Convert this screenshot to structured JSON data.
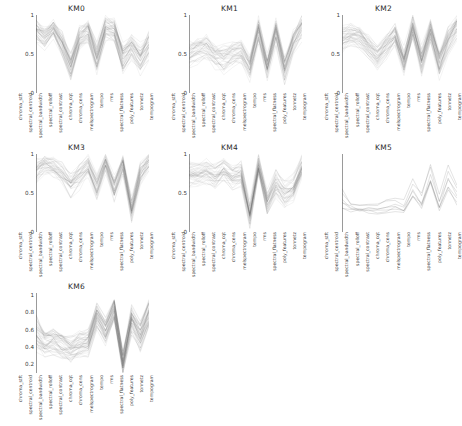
{
  "figure": {
    "type": "parallel-coordinates-grid",
    "background": "#ffffff",
    "line_color": "#555555",
    "grid_rows": 3,
    "grid_cols": 3,
    "panel_count": 7
  },
  "features": [
    "chroma_stft",
    "spectral_centroid",
    "spectral_bandwidth",
    "spectral_rolloff",
    "spectral_contrast",
    "chroma_cqt",
    "chroma_cens",
    "melspectrogram",
    "tempo",
    "rms",
    "spectral_flatness",
    "poly_features",
    "tonnetz",
    "tempogram"
  ],
  "panels": [
    {
      "id": "KM0",
      "title": "KM0",
      "row": 0,
      "col": 0,
      "yticks": [
        "0",
        "0.5",
        "1"
      ],
      "ytick_values": [
        0,
        0.5,
        1
      ],
      "ylim": [
        0,
        1
      ],
      "n_lines": 46,
      "density": "dense"
    },
    {
      "id": "KM1",
      "title": "KM1",
      "row": 0,
      "col": 1,
      "yticks": [
        "0",
        "0.5",
        "1"
      ],
      "ytick_values": [
        0,
        0.5,
        1
      ],
      "ylim": [
        0,
        1
      ],
      "n_lines": 40,
      "density": "dense"
    },
    {
      "id": "KM2",
      "title": "KM2",
      "row": 0,
      "col": 2,
      "yticks": [
        "0",
        "0.5",
        "1"
      ],
      "ytick_values": [
        0,
        0.5,
        1
      ],
      "ylim": [
        0,
        1
      ],
      "n_lines": 44,
      "density": "dense"
    },
    {
      "id": "KM3",
      "title": "KM3",
      "row": 1,
      "col": 0,
      "yticks": [
        "0",
        "0.5",
        "1"
      ],
      "ytick_values": [
        0,
        0.5,
        1
      ],
      "ylim": [
        0,
        1
      ],
      "n_lines": 38,
      "density": "dense"
    },
    {
      "id": "KM4",
      "title": "KM4",
      "row": 1,
      "col": 1,
      "yticks": [
        "0",
        "0.5",
        "1"
      ],
      "ytick_values": [
        0,
        0.5,
        1
      ],
      "ylim": [
        0,
        1
      ],
      "n_lines": 42,
      "density": "dense"
    },
    {
      "id": "KM5",
      "title": "KM5",
      "row": 1,
      "col": 2,
      "yticks": [],
      "ytick_values": [],
      "ylim": [
        0,
        1
      ],
      "n_lines": 7,
      "density": "sparse"
    },
    {
      "id": "KM6",
      "title": "KM6",
      "row": 2,
      "col": 0,
      "yticks": [
        "0.2",
        "0.4",
        "0.6",
        "0.8",
        "1"
      ],
      "ytick_values": [
        0.2,
        0.4,
        0.6,
        0.8,
        1
      ],
      "ylim": [
        0.1,
        1.02
      ],
      "n_lines": 48,
      "density": "dense"
    }
  ],
  "chart_data": {
    "type": "line",
    "title": "",
    "xlabel": "",
    "ylabel": "",
    "grid": false,
    "legend": "none",
    "categories": [
      "chroma_stft",
      "spectral_centroid",
      "spectral_bandwidth",
      "spectral_rolloff",
      "spectral_contrast",
      "chroma_cqt",
      "chroma_cens",
      "melspectrogram",
      "tempo",
      "rms",
      "spectral_flatness",
      "poly_features",
      "tonnetz",
      "tempogram"
    ],
    "panels": [
      {
        "name": "KM0",
        "ylim": [
          0,
          1
        ],
        "mean_profile": [
          0.79,
          0.7,
          0.82,
          0.62,
          0.33,
          0.7,
          0.79,
          0.44,
          0.82,
          0.8,
          0.45,
          0.58,
          0.43,
          0.62
        ],
        "band_low": [
          0.66,
          0.58,
          0.71,
          0.49,
          0.18,
          0.57,
          0.66,
          0.27,
          0.68,
          0.66,
          0.3,
          0.44,
          0.27,
          0.46
        ],
        "band_high": [
          0.9,
          0.82,
          0.93,
          0.76,
          0.5,
          0.84,
          0.92,
          0.62,
          0.95,
          0.92,
          0.62,
          0.73,
          0.6,
          0.79
        ]
      },
      {
        "name": "KM1",
        "ylim": [
          0,
          1
        ],
        "mean_profile": [
          0.5,
          0.55,
          0.58,
          0.48,
          0.44,
          0.5,
          0.52,
          0.32,
          0.8,
          0.33,
          0.78,
          0.3,
          0.66,
          0.85
        ],
        "band_low": [
          0.36,
          0.41,
          0.45,
          0.34,
          0.29,
          0.36,
          0.38,
          0.18,
          0.64,
          0.19,
          0.63,
          0.16,
          0.5,
          0.68
        ],
        "band_high": [
          0.64,
          0.7,
          0.72,
          0.63,
          0.6,
          0.65,
          0.67,
          0.48,
          0.93,
          0.49,
          0.92,
          0.46,
          0.82,
          0.97
        ]
      },
      {
        "name": "KM2",
        "ylim": [
          0,
          1
        ],
        "mean_profile": [
          0.7,
          0.75,
          0.72,
          0.6,
          0.46,
          0.62,
          0.74,
          0.4,
          0.84,
          0.42,
          0.8,
          0.38,
          0.68,
          0.86
        ],
        "band_low": [
          0.56,
          0.62,
          0.59,
          0.46,
          0.31,
          0.48,
          0.6,
          0.24,
          0.69,
          0.26,
          0.65,
          0.22,
          0.52,
          0.7
        ],
        "band_high": [
          0.85,
          0.89,
          0.86,
          0.75,
          0.62,
          0.77,
          0.89,
          0.57,
          0.97,
          0.59,
          0.94,
          0.55,
          0.84,
          0.98
        ]
      },
      {
        "name": "KM3",
        "ylim": [
          0,
          1
        ],
        "mean_profile": [
          0.78,
          0.85,
          0.82,
          0.74,
          0.6,
          0.72,
          0.84,
          0.56,
          0.88,
          0.55,
          0.86,
          0.26,
          0.74,
          0.9
        ],
        "band_low": [
          0.62,
          0.72,
          0.7,
          0.6,
          0.45,
          0.58,
          0.71,
          0.41,
          0.76,
          0.4,
          0.73,
          0.12,
          0.6,
          0.78
        ],
        "band_high": [
          0.92,
          0.96,
          0.94,
          0.88,
          0.76,
          0.87,
          0.96,
          0.72,
          0.98,
          0.71,
          0.97,
          0.42,
          0.88,
          0.99
        ]
      },
      {
        "name": "KM4",
        "ylim": [
          0,
          1
        ],
        "mean_profile": [
          0.76,
          0.74,
          0.78,
          0.72,
          0.8,
          0.72,
          0.75,
          0.22,
          0.86,
          0.38,
          0.62,
          0.5,
          0.56,
          0.84
        ],
        "band_low": [
          0.6,
          0.6,
          0.64,
          0.58,
          0.66,
          0.58,
          0.61,
          0.1,
          0.72,
          0.24,
          0.47,
          0.35,
          0.41,
          0.69
        ],
        "band_high": [
          0.9,
          0.88,
          0.92,
          0.86,
          0.93,
          0.86,
          0.89,
          0.38,
          0.97,
          0.54,
          0.78,
          0.66,
          0.72,
          0.97
        ]
      },
      {
        "name": "KM5",
        "ylim": [
          0,
          1
        ],
        "mean_profile": [
          0.42,
          0.33,
          0.31,
          0.3,
          0.29,
          0.32,
          0.34,
          0.33,
          0.54,
          0.4,
          0.74,
          0.38,
          0.7,
          0.48
        ],
        "band_low": [
          0.28,
          0.26,
          0.25,
          0.24,
          0.23,
          0.25,
          0.27,
          0.26,
          0.42,
          0.3,
          0.58,
          0.28,
          0.55,
          0.36
        ],
        "band_high": [
          0.58,
          0.42,
          0.4,
          0.38,
          0.38,
          0.41,
          0.44,
          0.48,
          0.68,
          0.52,
          0.9,
          0.5,
          0.86,
          0.62
        ]
      },
      {
        "name": "KM6",
        "ylim": [
          0.1,
          1.02
        ],
        "mean_profile": [
          0.56,
          0.44,
          0.47,
          0.42,
          0.36,
          0.43,
          0.45,
          0.76,
          0.58,
          0.82,
          0.22,
          0.72,
          0.52,
          0.78
        ],
        "band_low": [
          0.4,
          0.32,
          0.35,
          0.3,
          0.24,
          0.31,
          0.33,
          0.64,
          0.46,
          0.7,
          0.12,
          0.58,
          0.38,
          0.64
        ],
        "band_high": [
          0.74,
          0.58,
          0.6,
          0.56,
          0.5,
          0.57,
          0.59,
          0.88,
          0.72,
          0.93,
          0.34,
          0.86,
          0.68,
          0.92
        ]
      }
    ]
  }
}
